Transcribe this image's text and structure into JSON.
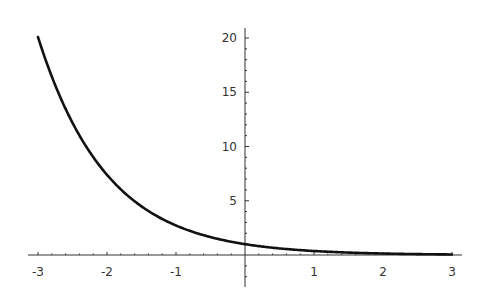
{
  "chart_data": {
    "type": "line",
    "title": "",
    "xlabel": "",
    "ylabel": "",
    "function": "y = e^(-x)",
    "xlim": [
      -3,
      3
    ],
    "ylim": [
      0,
      20.5
    ],
    "grid": false,
    "legend": null,
    "x_ticks": [
      -3,
      -2,
      -1,
      1,
      2,
      3
    ],
    "x_tick_labels": [
      "-3",
      "-2",
      "-1",
      "1",
      "2",
      "3"
    ],
    "y_ticks": [
      5,
      10,
      15,
      20
    ],
    "y_tick_labels": [
      "5",
      "10",
      "15",
      "20"
    ],
    "series": [
      {
        "name": "exp(-x)",
        "color": "#111111",
        "x": [
          -3,
          -2.5,
          -2,
          -1.5,
          -1,
          -0.5,
          0,
          0.5,
          1,
          1.5,
          2,
          2.5,
          3
        ],
        "y": [
          20.09,
          12.18,
          7.39,
          4.48,
          2.72,
          1.65,
          1.0,
          0.61,
          0.37,
          0.22,
          0.14,
          0.08,
          0.05
        ]
      }
    ]
  },
  "layout": {
    "origin_px": [
      245,
      255
    ],
    "x_px_per_unit": 69,
    "y_px_per_unit": 10.85,
    "axis_color": "#333333"
  }
}
